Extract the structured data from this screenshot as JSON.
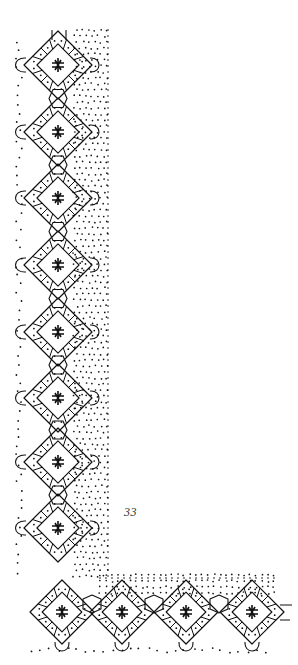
{
  "page": {
    "page_number": "33",
    "figure_type": "bobbin lace pricking and working diagram",
    "ink_color": "#111111",
    "paper_color": "#ffffff"
  },
  "figure": {
    "vertical_strip": {
      "motif_center_x": 58,
      "motif_centers_y": [
        65,
        132,
        198,
        265,
        332,
        398,
        462,
        528
      ],
      "motif_half_size": 34,
      "ground_dots_region": {
        "x0": 74,
        "x1": 108,
        "y0": 30,
        "y1": 580
      },
      "edge_dot_line_x": 108
    },
    "horizontal_strip": {
      "motif_center_y": 612,
      "motif_centers_x": [
        62,
        122,
        186,
        252
      ],
      "motif_half_size": 32,
      "ground_dots_region": {
        "x0": 100,
        "x1": 275,
        "y0": 575,
        "y1": 595
      },
      "edge_dot_line_y": 578
    }
  }
}
